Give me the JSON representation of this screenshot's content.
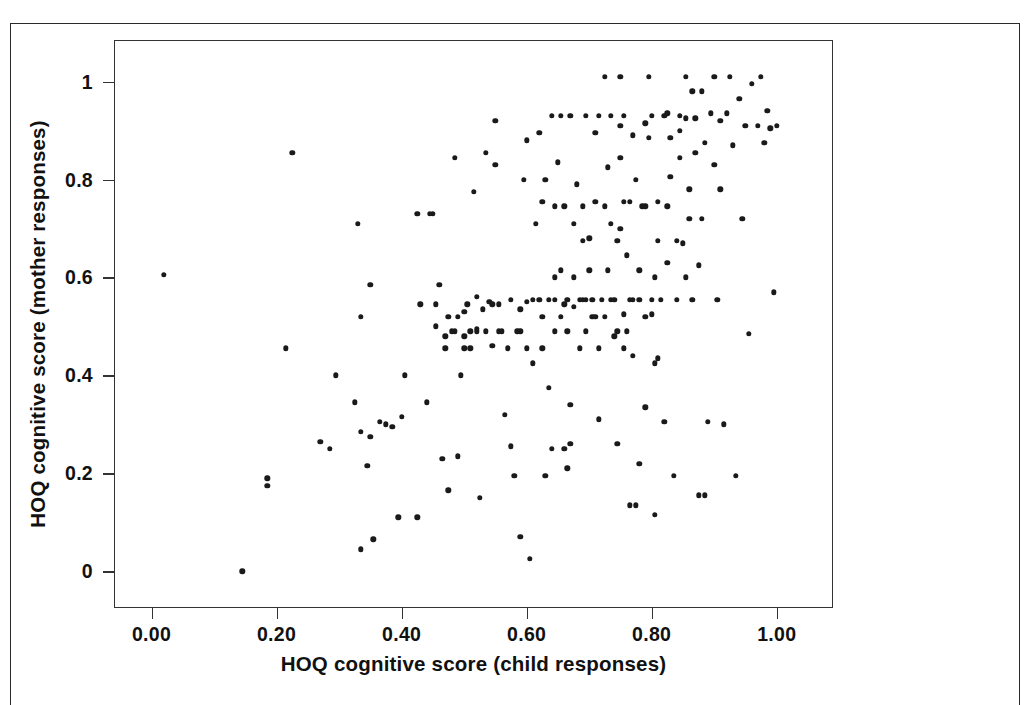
{
  "figure": {
    "background_color": "#ffffff",
    "point_color": "#1a1a1a",
    "axis_color": "#333333",
    "page_border_color": "#2a2a2a"
  },
  "chart_data": {
    "type": "scatter",
    "title": "",
    "xlabel": "HOQ cognitive score (child responses)",
    "ylabel": "HOQ cognitive score (mother responses)",
    "xlim": [
      -0.06,
      1.09
    ],
    "ylim": [
      -0.075,
      1.085
    ],
    "grid": false,
    "legend": null,
    "xticks": [
      0,
      0.2,
      0.4,
      0.6,
      0.8,
      1
    ],
    "xticklabels": [
      "0.00",
      "0.20",
      "0.40",
      "0.60",
      "0.80",
      "1.00"
    ],
    "yticks": [
      0,
      0.2,
      0.4,
      0.6,
      0.8,
      1
    ],
    "yticklabels": [
      "0",
      "0.2",
      "0.4",
      "0.6",
      "0.8",
      "1"
    ],
    "n_points": 232,
    "marker": "circle",
    "points": [
      [
        0.02,
        0.605
      ],
      [
        0.145,
        0.0
      ],
      [
        0.185,
        0.19
      ],
      [
        0.185,
        0.175
      ],
      [
        0.225,
        0.855
      ],
      [
        0.215,
        0.455
      ],
      [
        0.27,
        0.265
      ],
      [
        0.285,
        0.25
      ],
      [
        0.295,
        0.4
      ],
      [
        0.325,
        0.345
      ],
      [
        0.33,
        0.71
      ],
      [
        0.335,
        0.52
      ],
      [
        0.335,
        0.285
      ],
      [
        0.335,
        0.045
      ],
      [
        0.345,
        0.215
      ],
      [
        0.35,
        0.585
      ],
      [
        0.35,
        0.275
      ],
      [
        0.355,
        0.065
      ],
      [
        0.365,
        0.305
      ],
      [
        0.375,
        0.3
      ],
      [
        0.385,
        0.295
      ],
      [
        0.395,
        0.11
      ],
      [
        0.4,
        0.315
      ],
      [
        0.405,
        0.4
      ],
      [
        0.425,
        0.11
      ],
      [
        0.425,
        0.73
      ],
      [
        0.43,
        0.545
      ],
      [
        0.44,
        0.345
      ],
      [
        0.45,
        0.73
      ],
      [
        0.455,
        0.545
      ],
      [
        0.46,
        0.585
      ],
      [
        0.465,
        0.23
      ],
      [
        0.47,
        0.48
      ],
      [
        0.47,
        0.455
      ],
      [
        0.475,
        0.165
      ],
      [
        0.48,
        0.49
      ],
      [
        0.485,
        0.845
      ],
      [
        0.49,
        0.235
      ],
      [
        0.495,
        0.4
      ],
      [
        0.5,
        0.53
      ],
      [
        0.5,
        0.455
      ],
      [
        0.5,
        0.48
      ],
      [
        0.505,
        0.545
      ],
      [
        0.51,
        0.49
      ],
      [
        0.515,
        0.775
      ],
      [
        0.52,
        0.56
      ],
      [
        0.525,
        0.15
      ],
      [
        0.53,
        0.535
      ],
      [
        0.535,
        0.855
      ],
      [
        0.535,
        0.49
      ],
      [
        0.54,
        0.55
      ],
      [
        0.545,
        0.46
      ],
      [
        0.55,
        0.92
      ],
      [
        0.55,
        0.83
      ],
      [
        0.555,
        0.545
      ],
      [
        0.56,
        0.49
      ],
      [
        0.565,
        0.32
      ],
      [
        0.57,
        0.455
      ],
      [
        0.575,
        0.255
      ],
      [
        0.58,
        0.195
      ],
      [
        0.585,
        0.49
      ],
      [
        0.59,
        0.07
      ],
      [
        0.59,
        0.535
      ],
      [
        0.595,
        0.8
      ],
      [
        0.6,
        0.88
      ],
      [
        0.6,
        0.55
      ],
      [
        0.605,
        0.025
      ],
      [
        0.61,
        0.425
      ],
      [
        0.615,
        0.71
      ],
      [
        0.62,
        0.555
      ],
      [
        0.625,
        0.755
      ],
      [
        0.625,
        0.52
      ],
      [
        0.63,
        0.195
      ],
      [
        0.635,
        0.375
      ],
      [
        0.64,
        0.25
      ],
      [
        0.645,
        0.555
      ],
      [
        0.645,
        0.6
      ],
      [
        0.65,
        0.835
      ],
      [
        0.655,
        0.93
      ],
      [
        0.655,
        0.52
      ],
      [
        0.66,
        0.25
      ],
      [
        0.665,
        0.555
      ],
      [
        0.665,
        0.21
      ],
      [
        0.67,
        0.26
      ],
      [
        0.67,
        0.34
      ],
      [
        0.675,
        0.54
      ],
      [
        0.68,
        0.79
      ],
      [
        0.685,
        0.455
      ],
      [
        0.69,
        0.745
      ],
      [
        0.695,
        0.555
      ],
      [
        0.7,
        0.68
      ],
      [
        0.7,
        0.615
      ],
      [
        0.705,
        0.52
      ],
      [
        0.71,
        0.895
      ],
      [
        0.715,
        0.31
      ],
      [
        0.72,
        0.555
      ],
      [
        0.725,
        1.01
      ],
      [
        0.73,
        0.825
      ],
      [
        0.735,
        0.555
      ],
      [
        0.74,
        0.48
      ],
      [
        0.745,
        0.26
      ],
      [
        0.75,
        1.01
      ],
      [
        0.75,
        0.91
      ],
      [
        0.75,
        0.845
      ],
      [
        0.755,
        0.755
      ],
      [
        0.755,
        0.525
      ],
      [
        0.76,
        0.645
      ],
      [
        0.765,
        0.555
      ],
      [
        0.765,
        0.135
      ],
      [
        0.77,
        0.44
      ],
      [
        0.775,
        0.135
      ],
      [
        0.78,
        0.22
      ],
      [
        0.78,
        0.555
      ],
      [
        0.785,
        0.745
      ],
      [
        0.79,
        0.335
      ],
      [
        0.79,
        0.915
      ],
      [
        0.795,
        1.01
      ],
      [
        0.795,
        0.885
      ],
      [
        0.8,
        0.525
      ],
      [
        0.805,
        0.425
      ],
      [
        0.805,
        0.115
      ],
      [
        0.81,
        0.675
      ],
      [
        0.81,
        0.435
      ],
      [
        0.815,
        0.555
      ],
      [
        0.82,
        0.305
      ],
      [
        0.825,
        0.935
      ],
      [
        0.83,
        0.885
      ],
      [
        0.83,
        0.805
      ],
      [
        0.835,
        0.195
      ],
      [
        0.84,
        0.555
      ],
      [
        0.845,
        0.9
      ],
      [
        0.845,
        0.845
      ],
      [
        0.85,
        0.67
      ],
      [
        0.855,
        1.01
      ],
      [
        0.855,
        0.925
      ],
      [
        0.86,
        0.78
      ],
      [
        0.86,
        0.72
      ],
      [
        0.865,
        0.555
      ],
      [
        0.87,
        0.925
      ],
      [
        0.87,
        0.855
      ],
      [
        0.875,
        0.625
      ],
      [
        0.875,
        0.155
      ],
      [
        0.88,
        0.98
      ],
      [
        0.88,
        0.72
      ],
      [
        0.885,
        0.875
      ],
      [
        0.885,
        0.155
      ],
      [
        0.89,
        0.305
      ],
      [
        0.895,
        0.935
      ],
      [
        0.9,
        1.01
      ],
      [
        0.9,
        0.83
      ],
      [
        0.905,
        0.555
      ],
      [
        0.91,
        0.92
      ],
      [
        0.91,
        0.78
      ],
      [
        0.915,
        0.3
      ],
      [
        0.92,
        0.935
      ],
      [
        0.925,
        1.01
      ],
      [
        0.93,
        0.87
      ],
      [
        0.935,
        0.195
      ],
      [
        0.94,
        0.965
      ],
      [
        0.945,
        0.72
      ],
      [
        0.95,
        0.91
      ],
      [
        0.955,
        0.485
      ],
      [
        0.96,
        0.995
      ],
      [
        0.97,
        0.91
      ],
      [
        0.975,
        1.01
      ],
      [
        0.98,
        0.875
      ],
      [
        0.985,
        0.94
      ],
      [
        0.99,
        0.905
      ],
      [
        0.995,
        0.57
      ],
      [
        1.0,
        0.91
      ],
      [
        0.455,
        0.5
      ],
      [
        0.485,
        0.49
      ],
      [
        0.52,
        0.495
      ],
      [
        0.545,
        0.545
      ],
      [
        0.49,
        0.52
      ],
      [
        0.475,
        0.52
      ],
      [
        0.59,
        0.49
      ],
      [
        0.6,
        0.455
      ],
      [
        0.61,
        0.555
      ],
      [
        0.635,
        0.555
      ],
      [
        0.66,
        0.545
      ],
      [
        0.685,
        0.555
      ],
      [
        0.705,
        0.555
      ],
      [
        0.71,
        0.52
      ],
      [
        0.725,
        0.52
      ],
      [
        0.74,
        0.555
      ],
      [
        0.755,
        0.455
      ],
      [
        0.77,
        0.555
      ],
      [
        0.79,
        0.52
      ],
      [
        0.8,
        0.555
      ],
      [
        0.63,
        0.8
      ],
      [
        0.645,
        0.745
      ],
      [
        0.66,
        0.745
      ],
      [
        0.675,
        0.71
      ],
      [
        0.69,
        0.675
      ],
      [
        0.71,
        0.755
      ],
      [
        0.725,
        0.745
      ],
      [
        0.735,
        0.71
      ],
      [
        0.75,
        0.7
      ],
      [
        0.765,
        0.755
      ],
      [
        0.775,
        0.8
      ],
      [
        0.79,
        0.745
      ],
      [
        0.81,
        0.755
      ],
      [
        0.825,
        0.745
      ],
      [
        0.62,
        0.895
      ],
      [
        0.64,
        0.93
      ],
      [
        0.67,
        0.93
      ],
      [
        0.695,
        0.93
      ],
      [
        0.715,
        0.93
      ],
      [
        0.735,
        0.93
      ],
      [
        0.755,
        0.93
      ],
      [
        0.77,
        0.89
      ],
      [
        0.8,
        0.93
      ],
      [
        0.82,
        0.93
      ],
      [
        0.845,
        0.93
      ],
      [
        0.865,
        0.98
      ],
      [
        0.575,
        0.555
      ],
      [
        0.555,
        0.49
      ],
      [
        0.51,
        0.455
      ],
      [
        0.445,
        0.73
      ],
      [
        0.52,
        0.49
      ],
      [
        0.625,
        0.455
      ],
      [
        0.645,
        0.49
      ],
      [
        0.665,
        0.49
      ],
      [
        0.695,
        0.49
      ],
      [
        0.715,
        0.455
      ],
      [
        0.745,
        0.49
      ],
      [
        0.76,
        0.49
      ],
      [
        0.675,
        0.6
      ],
      [
        0.69,
        0.555
      ],
      [
        0.655,
        0.615
      ],
      [
        0.73,
        0.615
      ],
      [
        0.745,
        0.675
      ],
      [
        0.78,
        0.615
      ],
      [
        0.805,
        0.6
      ],
      [
        0.825,
        0.63
      ],
      [
        0.84,
        0.675
      ],
      [
        0.855,
        0.6
      ]
    ]
  },
  "axis_titles": {
    "x": "HOQ cognitive score (child responses)",
    "y": "HOQ cognitive score (mother responses)"
  }
}
